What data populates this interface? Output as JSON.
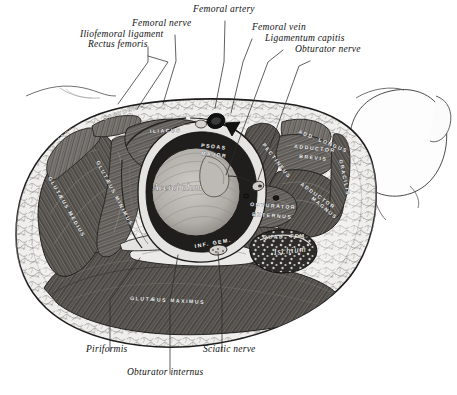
{
  "figure": {
    "domain": "anatomical-illustration",
    "background_color": "#ffffff",
    "ink_color": "#1a1a1a",
    "muscle_dark_color": "#55524f",
    "muscle_mid_color": "#6f6b67",
    "fat_color": "#e8e8e6",
    "bone_color": "#d6d3cf",
    "vessel_color": "#141414"
  },
  "callouts": {
    "top": [
      {
        "id": "iliofemoral-ligament",
        "text": "Iliofemoral ligament",
        "x": 80,
        "y": 37,
        "align": "left",
        "leader": [
          [
            148,
            47
          ],
          [
            148,
            62
          ],
          [
            118,
            104
          ]
        ]
      },
      {
        "id": "rectus-femoris",
        "text": "Rectus femoris",
        "x": 88,
        "y": 47,
        "align": "left",
        "leader": [
          [
            148,
            56
          ],
          [
            168,
            62
          ],
          [
            137,
            109
          ]
        ]
      },
      {
        "id": "femoral-nerve",
        "text": "Femoral nerve",
        "x": 132,
        "y": 26,
        "align": "left",
        "leader": [
          [
            175,
            35
          ],
          [
            176,
            61
          ],
          [
            163,
            104
          ]
        ]
      },
      {
        "id": "femoral-artery",
        "text": "Femoral artery",
        "x": 193,
        "y": 12,
        "align": "left",
        "leader": [
          [
            225,
            21
          ],
          [
            224,
            62
          ],
          [
            215,
            108
          ]
        ]
      },
      {
        "id": "femoral-vein",
        "text": "Femoral vein",
        "x": 252,
        "y": 30,
        "align": "left",
        "leader": [
          [
            252,
            39
          ],
          [
            243,
            62
          ],
          [
            231,
            113
          ]
        ]
      },
      {
        "id": "ligamentum-capitis",
        "text": "Ligamentum capitis",
        "x": 265,
        "y": 41,
        "align": "left",
        "leader": [
          [
            283,
            50
          ],
          [
            268,
            62
          ],
          [
            226,
            175
          ]
        ]
      },
      {
        "id": "obturator-nerve",
        "text": "Obturator nerve",
        "x": 295,
        "y": 52,
        "align": "left",
        "leader": [
          [
            310,
            61
          ],
          [
            299,
            66
          ],
          [
            258,
            180
          ]
        ]
      }
    ],
    "bottom": [
      {
        "id": "piriformis",
        "text": "Piriformis",
        "x": 86,
        "y": 352,
        "align": "left",
        "leader": [
          [
            110,
            351
          ],
          [
            110,
            300
          ],
          [
            140,
            258
          ]
        ]
      },
      {
        "id": "obturator-internus",
        "text": "Obturator internus",
        "x": 127,
        "y": 375,
        "align": "left",
        "leader": [
          [
            170,
            374
          ],
          [
            170,
            300
          ],
          [
            178,
            255
          ]
        ]
      },
      {
        "id": "sciatic-nerve",
        "text": "Sciatic nerve",
        "x": 203,
        "y": 352,
        "align": "left",
        "leader": [
          [
            222,
            351
          ],
          [
            222,
            300
          ],
          [
            218,
            252
          ]
        ]
      }
    ]
  },
  "muscle_labels": [
    {
      "id": "tensor-fasciae-latae",
      "text": "TENS. FASCIÆ",
      "x": 58,
      "y": 140,
      "rot": -42,
      "tone": "light"
    },
    {
      "id": "sartorius",
      "text": "SARTORIUS",
      "x": 104,
      "y": 120,
      "rot": -18,
      "tone": "light"
    },
    {
      "id": "iliacus",
      "text": "ILIACUS",
      "x": 150,
      "y": 133,
      "rot": -2,
      "tone": "light"
    },
    {
      "id": "psoas-major-1",
      "text": "PSOAS",
      "x": 201,
      "y": 147,
      "rot": 6,
      "tone": "light"
    },
    {
      "id": "psoas-major-2",
      "text": "MAJOR",
      "x": 201,
      "y": 155,
      "rot": 6,
      "tone": "light"
    },
    {
      "id": "gluteus-minimus",
      "text": "GLUTÆUS MINIMUS",
      "x": 96,
      "y": 162,
      "rot": 62,
      "tone": "light"
    },
    {
      "id": "gluteus-medius",
      "text": "GLUTÆUS MEDIUS",
      "x": 48,
      "y": 178,
      "rot": 60,
      "tone": "light"
    },
    {
      "id": "pectineus",
      "text": "PECTINEUS",
      "x": 262,
      "y": 145,
      "rot": 52,
      "tone": "light"
    },
    {
      "id": "add-longus",
      "text": "ADD. LONGUS",
      "x": 298,
      "y": 133,
      "rot": 22,
      "tone": "light"
    },
    {
      "id": "adductor-brevis-1",
      "text": "ADDUCTOR",
      "x": 294,
      "y": 148,
      "rot": 6,
      "tone": "light"
    },
    {
      "id": "adductor-brevis-2",
      "text": "BREVIS",
      "x": 299,
      "y": 158,
      "rot": 6,
      "tone": "light"
    },
    {
      "id": "adductor-magnus-1",
      "text": "ADDUCTOR",
      "x": 300,
      "y": 185,
      "rot": 36,
      "tone": "light"
    },
    {
      "id": "adductor-magnus-2",
      "text": "MAGNUS",
      "x": 311,
      "y": 199,
      "rot": 40,
      "tone": "light"
    },
    {
      "id": "gracilis",
      "text": "GRACILIS",
      "x": 339,
      "y": 160,
      "rot": 78,
      "tone": "light"
    },
    {
      "id": "obturator-externus-1",
      "text": "OBTURATOR",
      "x": 250,
      "y": 206,
      "rot": 4,
      "tone": "light"
    },
    {
      "id": "obturator-externus-2",
      "text": "EXTERNUS",
      "x": 252,
      "y": 216,
      "rot": 4,
      "tone": "light"
    },
    {
      "id": "quadratus-femoris",
      "text": "QUAD. FEM.",
      "x": 263,
      "y": 239,
      "rot": -2,
      "tone": "light"
    },
    {
      "id": "inferior-gemellus",
      "text": "INF. GEM.",
      "x": 195,
      "y": 248,
      "rot": -10,
      "tone": "dark"
    },
    {
      "id": "gluteus-maximus",
      "text": "GLUTÆUS   MAXIMUS",
      "x": 130,
      "y": 300,
      "rot": 3,
      "tone": "light"
    }
  ],
  "script_labels": [
    {
      "id": "acetabulum",
      "text": "Acetabulum",
      "x": 153,
      "y": 190,
      "rot": 0
    },
    {
      "id": "ischium",
      "text": "Ischium",
      "x": 274,
      "y": 255,
      "rot": -6
    }
  ]
}
